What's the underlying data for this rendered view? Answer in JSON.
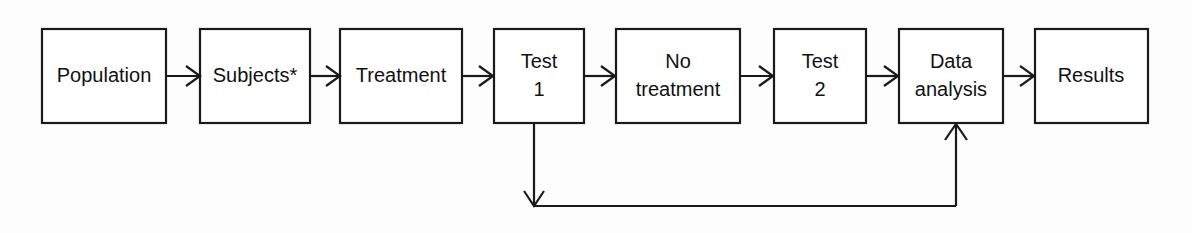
{
  "diagram": {
    "type": "flowchart",
    "orientation": "left-to-right",
    "background_color": "#fdfdfd",
    "line_color": "#1a1a1a",
    "text_color": "#111111",
    "nodes": [
      {
        "id": "population",
        "label": "Population",
        "lines": [
          "Population"
        ],
        "shape": "rectangle",
        "x": 42,
        "y": 29,
        "w": 124,
        "h": 94
      },
      {
        "id": "subjects",
        "label": "Subjects*",
        "lines": [
          "Subjects*"
        ],
        "shape": "rectangle",
        "x": 200,
        "y": 29,
        "w": 110,
        "h": 94
      },
      {
        "id": "treatment",
        "label": "Treatment",
        "lines": [
          "Treatment"
        ],
        "shape": "rectangle",
        "x": 340,
        "y": 29,
        "w": 122,
        "h": 94
      },
      {
        "id": "test-1",
        "label": "Test 1",
        "lines": [
          "Test",
          "1"
        ],
        "shape": "rectangle",
        "x": 494,
        "y": 29,
        "w": 90,
        "h": 94
      },
      {
        "id": "no-treatment",
        "label": "No treatment",
        "lines": [
          "No",
          "treatment"
        ],
        "shape": "rectangle",
        "x": 616,
        "y": 29,
        "w": 124,
        "h": 94
      },
      {
        "id": "test-2",
        "label": "Test 2",
        "lines": [
          "Test",
          "2"
        ],
        "shape": "rectangle",
        "x": 774,
        "y": 29,
        "w": 92,
        "h": 94
      },
      {
        "id": "data-analysis",
        "label": "Data analysis",
        "lines": [
          "Data",
          "analysis"
        ],
        "shape": "rectangle",
        "x": 899,
        "y": 29,
        "w": 104,
        "h": 94
      },
      {
        "id": "results",
        "label": "Results",
        "lines": [
          "Results"
        ],
        "shape": "rectangle",
        "x": 1035,
        "y": 29,
        "w": 113,
        "h": 94
      }
    ],
    "edges": [
      {
        "id": "population-to-subjects",
        "from": "population",
        "to": "subjects",
        "style": "straight-arrow",
        "direction": "right"
      },
      {
        "id": "subjects-to-treatment",
        "from": "subjects",
        "to": "treatment",
        "style": "straight-arrow",
        "direction": "right"
      },
      {
        "id": "treatment-to-test-1",
        "from": "treatment",
        "to": "test-1",
        "style": "straight-arrow",
        "direction": "right"
      },
      {
        "id": "test-1-to-no-treatment",
        "from": "test-1",
        "to": "no-treatment",
        "style": "straight-arrow",
        "direction": "right"
      },
      {
        "id": "no-treatment-to-test-2",
        "from": "no-treatment",
        "to": "test-2",
        "style": "straight-arrow",
        "direction": "right"
      },
      {
        "id": "test-2-to-data-analysis",
        "from": "test-2",
        "to": "data-analysis",
        "style": "straight-arrow",
        "direction": "right"
      },
      {
        "id": "data-analysis-to-results",
        "from": "data-analysis",
        "to": "results",
        "style": "straight-arrow",
        "direction": "right"
      },
      {
        "id": "test-1-to-feedback-line",
        "from": "test-1",
        "to": "feedback-line",
        "style": "vertical-arrow",
        "direction": "down"
      },
      {
        "id": "feedback-line-to-data-analysis",
        "from": "feedback-line",
        "to": "data-analysis",
        "style": "elbow-arrow",
        "direction": "up"
      }
    ]
  }
}
